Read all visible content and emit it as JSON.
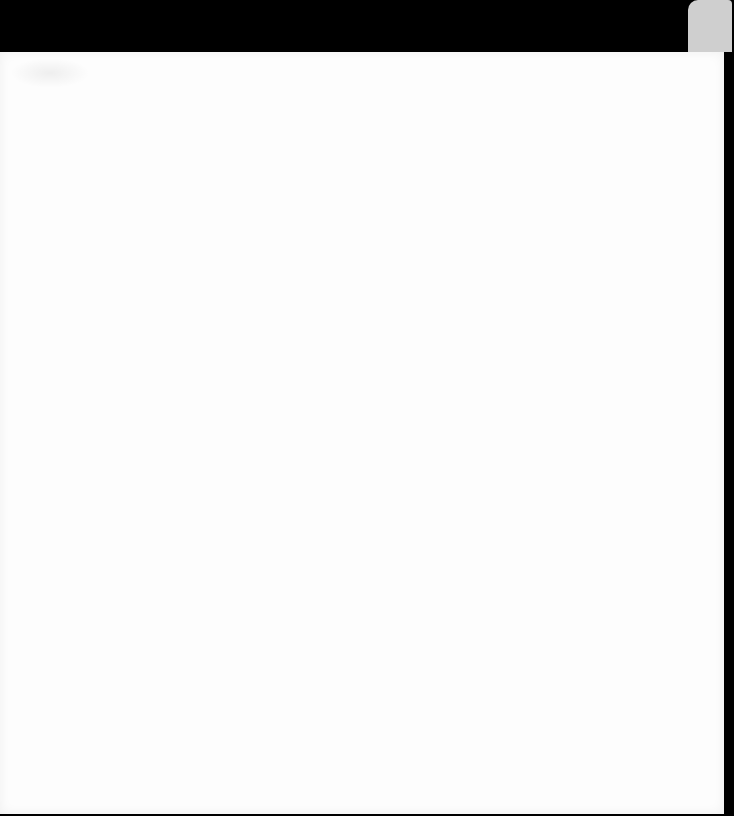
{
  "page": {
    "content": ""
  }
}
